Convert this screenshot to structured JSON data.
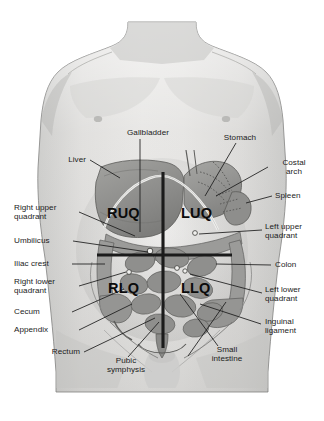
{
  "figure": {
    "background_color": "#ffffff",
    "frame_color": "#e4e4e4",
    "skin_color": "#d8d8d6",
    "organ_color": "#9a9a98",
    "line_color": "#1b1b1b"
  },
  "quadrant_labels": [
    {
      "abbr": "RUQ",
      "name": "Right upper quadrant"
    },
    {
      "abbr": "LUQ",
      "name": "Left upper quadrant"
    },
    {
      "abbr": "RLQ",
      "name": "Right lower quadrant"
    },
    {
      "abbr": "LLQ",
      "name": "Left lower quadrant"
    }
  ],
  "labels": {
    "gallbladder": "Gallbladder",
    "stomach": "Stomach",
    "liver": "Liver",
    "costal_arch_line1": "Costal",
    "costal_arch_line2": "arch",
    "spleen": "Spleen",
    "right_upper_quadrant_line1": "Right upper",
    "right_upper_quadrant_line2": "quadrant",
    "left_upper_quadrant_line1": "Left upper",
    "left_upper_quadrant_line2": "quadrant",
    "umbilicus": "Umbilicus",
    "iliac_crest": "Iliac crest",
    "colon": "Colon",
    "right_lower_quadrant_line1": "Right lower",
    "right_lower_quadrant_line2": "quadrant",
    "left_lower_quadrant_line1": "Left lower",
    "left_lower_quadrant_line2": "quadrant",
    "cecum": "Cecum",
    "appendix": "Appendix",
    "inguinal_ligament_line1": "Inguinal",
    "inguinal_ligament_line2": "ligament",
    "rectum": "Rectum",
    "pubic_symphysis_line1": "Pubic",
    "pubic_symphysis_line2": "symphysis",
    "small_intestine_line1": "Small",
    "small_intestine_line2": "intestine",
    "ruq": "RUQ",
    "luq": "LUQ",
    "rlq": "RLQ",
    "llq": "LLQ"
  }
}
